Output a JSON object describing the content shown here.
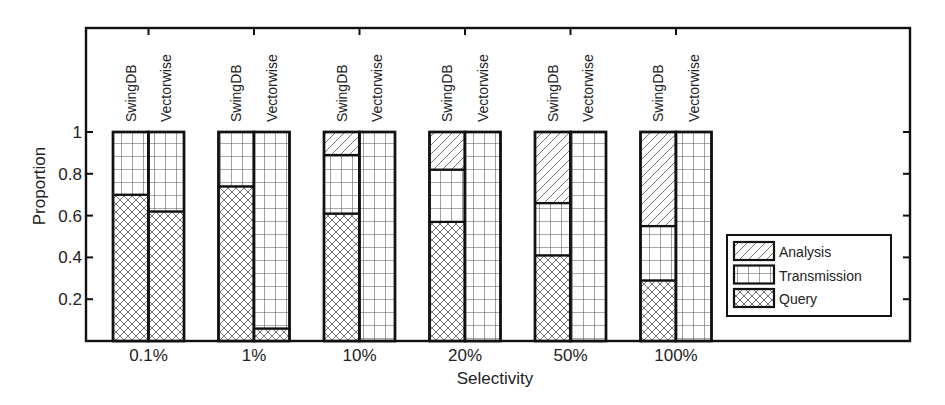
{
  "chart_data": {
    "type": "bar",
    "stacked": true,
    "title": "",
    "xlabel": "Selectivity",
    "ylabel": "Proportion",
    "ylim": [
      0,
      1.0
    ],
    "yticks": [
      0.2,
      0.4,
      0.6,
      0.8,
      1
    ],
    "ytick_labels": [
      "0.2",
      "0.4",
      "0.6",
      "0.8",
      "1"
    ],
    "categories": [
      "0.1%",
      "1%",
      "10%",
      "20%",
      "50%",
      "100%"
    ],
    "systems": [
      "SwingDB",
      "Vectorwise"
    ],
    "legend": {
      "position": "right-inside",
      "entries": [
        "Analysis",
        "Transmission",
        "Query"
      ]
    },
    "grid": false,
    "series": [
      {
        "name": "Query",
        "pattern": "crosshatch",
        "values": {
          "SwingDB": [
            0.7,
            0.74,
            0.61,
            0.57,
            0.41,
            0.29
          ],
          "Vectorwise": [
            0.62,
            0.06,
            0.0,
            0.0,
            0.0,
            0.0
          ]
        }
      },
      {
        "name": "Transmission",
        "pattern": "grid",
        "values": {
          "SwingDB": [
            0.3,
            0.26,
            0.28,
            0.25,
            0.25,
            0.26
          ],
          "Vectorwise": [
            0.38,
            0.94,
            1.0,
            1.0,
            1.0,
            1.0
          ]
        }
      },
      {
        "name": "Analysis",
        "pattern": "diagonal",
        "values": {
          "SwingDB": [
            0.0,
            0.0,
            0.11,
            0.18,
            0.34,
            0.45
          ],
          "Vectorwise": [
            0.0,
            0.0,
            0.0,
            0.0,
            0.0,
            0.0
          ]
        }
      }
    ]
  },
  "colors": {
    "axis": "#111111",
    "bar_edge": "#111111",
    "hatch": "#555555",
    "background": "#ffffff"
  }
}
